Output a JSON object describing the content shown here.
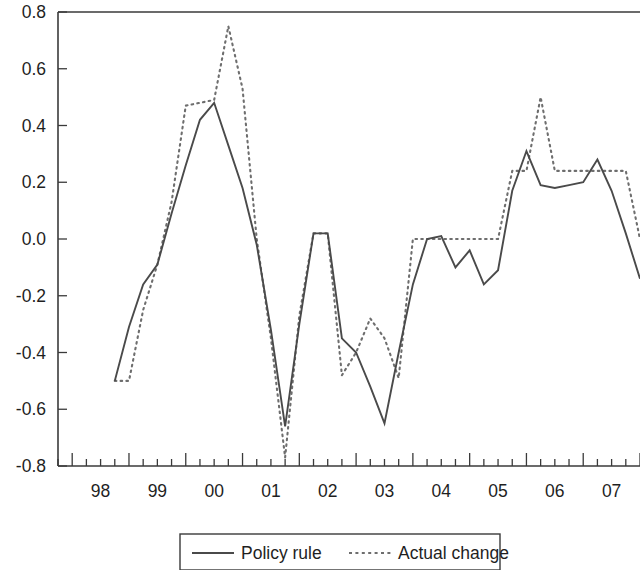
{
  "chart_data": {
    "type": "line",
    "title": "",
    "subtitle": "",
    "xlabel": "",
    "ylabel": "",
    "xlim": [
      1997.75,
      2008.0
    ],
    "ylim": [
      -0.8,
      0.8
    ],
    "grid": false,
    "legend_position": "bottom-center",
    "x_tick_labels": [
      "98",
      "99",
      "00",
      "01",
      "02",
      "03",
      "04",
      "05",
      "06",
      "07"
    ],
    "x_tick_values": [
      1998,
      1999,
      2000,
      2001,
      2002,
      2003,
      2004,
      2005,
      2006,
      2007
    ],
    "x_minor_ticks_per_year": 4,
    "y_tick_labels": [
      "0.8",
      "0.6",
      "0.4",
      "0.2",
      "0.0",
      "-0.2",
      "-0.4",
      "-0.6",
      "-0.8"
    ],
    "y_tick_values": [
      0.8,
      0.6,
      0.4,
      0.2,
      0.0,
      -0.2,
      -0.4,
      -0.6,
      -0.8
    ],
    "x": [
      1998.75,
      1999.0,
      1999.25,
      1999.5,
      1999.75,
      2000.0,
      2000.25,
      2000.5,
      2000.75,
      2001.0,
      2001.25,
      2001.5,
      2001.75,
      2002.0,
      2002.25,
      2002.5,
      2002.75,
      2003.0,
      2003.25,
      2003.5,
      2003.75,
      2004.0,
      2004.25,
      2004.5,
      2004.75,
      2005.0,
      2005.25,
      2005.5,
      2005.75,
      2006.0,
      2006.25,
      2006.5,
      2006.75,
      2007.0,
      2007.25,
      2007.5,
      2007.75,
      2008.0
    ],
    "series": [
      {
        "name": "Policy rule",
        "style": "solid",
        "color": "#4a4a4a",
        "values": [
          -0.5,
          -0.31,
          -0.16,
          -0.09,
          0.09,
          0.26,
          0.42,
          0.48,
          0.33,
          0.18,
          -0.02,
          -0.32,
          -0.66,
          -0.3,
          0.02,
          0.02,
          -0.35,
          -0.4,
          -0.52,
          -0.65,
          -0.4,
          -0.16,
          0.0,
          0.01,
          -0.1,
          -0.04,
          -0.16,
          -0.11,
          0.17,
          0.31,
          0.19,
          0.18,
          0.19,
          0.2,
          0.28,
          0.17,
          0.02,
          -0.14
        ]
      },
      {
        "name": "Actual change",
        "style": "dashed",
        "color": "#6e6e6e",
        "values": [
          -0.5,
          -0.5,
          -0.25,
          -0.09,
          0.13,
          0.47,
          0.48,
          0.49,
          0.75,
          0.53,
          0.0,
          -0.35,
          -0.77,
          -0.27,
          0.02,
          0.02,
          -0.48,
          -0.4,
          -0.28,
          -0.35,
          -0.49,
          0.0,
          0.0,
          0.0,
          0.0,
          0.0,
          0.0,
          0.0,
          0.24,
          0.24,
          0.5,
          0.24,
          0.24,
          0.24,
          0.24,
          0.24,
          0.24,
          0.0
        ]
      }
    ]
  },
  "legend": {
    "entries": [
      {
        "label": "Policy rule",
        "style": "solid"
      },
      {
        "label": "Actual change",
        "style": "dashed"
      }
    ]
  },
  "axes": {
    "y_axis_name": "value-axis",
    "x_axis_name": "year-axis"
  }
}
